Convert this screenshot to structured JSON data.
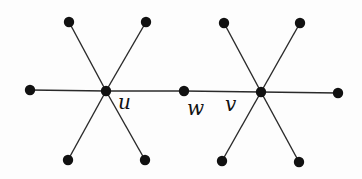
{
  "diagram": {
    "type": "graph",
    "labels": {
      "u": "u",
      "w": "w",
      "v": "v"
    },
    "vertices": [
      {
        "id": "u",
        "x": 106,
        "y": 91
      },
      {
        "id": "w",
        "x": 184,
        "y": 91
      },
      {
        "id": "v",
        "x": 261,
        "y": 92
      },
      {
        "id": "u1",
        "x": 69,
        "y": 22
      },
      {
        "id": "u2",
        "x": 146,
        "y": 22
      },
      {
        "id": "u3",
        "x": 30,
        "y": 90
      },
      {
        "id": "u4",
        "x": 68,
        "y": 160
      },
      {
        "id": "u5",
        "x": 145,
        "y": 160
      },
      {
        "id": "v1",
        "x": 224,
        "y": 23
      },
      {
        "id": "v2",
        "x": 300,
        "y": 23
      },
      {
        "id": "v3",
        "x": 338,
        "y": 93
      },
      {
        "id": "v4",
        "x": 222,
        "y": 161
      },
      {
        "id": "v5",
        "x": 299,
        "y": 162
      }
    ],
    "edges": [
      [
        "u",
        "u1"
      ],
      [
        "u",
        "u2"
      ],
      [
        "u",
        "u3"
      ],
      [
        "u",
        "u4"
      ],
      [
        "u",
        "u5"
      ],
      [
        "u",
        "w"
      ],
      [
        "w",
        "v"
      ],
      [
        "v",
        "v1"
      ],
      [
        "v",
        "v2"
      ],
      [
        "v",
        "v3"
      ],
      [
        "v",
        "v4"
      ],
      [
        "v",
        "v5"
      ]
    ],
    "colors": {
      "edge": "#2a2a2a",
      "vertex": "#111111",
      "background": "#fdfdfd"
    }
  }
}
